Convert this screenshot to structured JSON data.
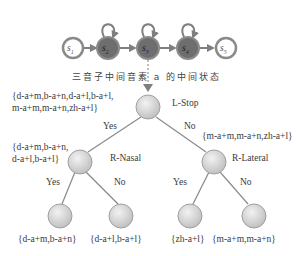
{
  "hmm": {
    "states": [
      {
        "id": "s1",
        "base": "s",
        "sub": "1",
        "emitting": false
      },
      {
        "id": "s2",
        "base": "s",
        "sub": "2",
        "emitting": true
      },
      {
        "id": "s3",
        "base": "s",
        "sub": "3",
        "emitting": true
      },
      {
        "id": "s4",
        "base": "s",
        "sub": "4",
        "emitting": true
      },
      {
        "id": "s5",
        "base": "s",
        "sub": "5",
        "emitting": false
      }
    ],
    "caption": "三音子中间音素 a 的中间状态"
  },
  "tree": {
    "root": {
      "question": "L-Stop",
      "set": "{d-a+m,b-a+n,d-a+l,b-a+l,",
      "set_line2": "m-a+m,m-a+n,zh-a+l}"
    },
    "left": {
      "edge": "Yes",
      "question": "R-Nasal",
      "set": "{d-a+m,b-a+n,",
      "set_line2": "d-a+l,b-a+l}"
    },
    "right": {
      "edge": "No",
      "question": "R-Lateral",
      "set": "{m-a+m,m-a+n,zh-a+l}"
    },
    "leaves": [
      {
        "edge": "Yes",
        "set": "{d-a+m,b-a+n}"
      },
      {
        "edge": "No",
        "set": "{d-a+l,b-a+l}"
      },
      {
        "edge": "Yes",
        "set": "{zh-a+l}"
      },
      {
        "edge": "No",
        "set": "{m-a+m,m-a+n}"
      }
    ]
  },
  "colors": {
    "node_fill": "#d9d9d9",
    "emitting_fill": "#6e6e6e",
    "edge": "#7f7f7f",
    "outline": "#8a8a8a"
  }
}
